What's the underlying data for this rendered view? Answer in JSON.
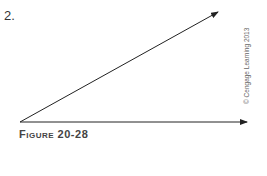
{
  "problem": {
    "number": "2."
  },
  "figure": {
    "caption": "Figure 20-28",
    "copyright": "© Cengage Learning 2013",
    "angle": {
      "vertex": [
        20,
        122
      ],
      "ray_horizontal_end": [
        248,
        122
      ],
      "ray_diagonal_end": [
        218,
        12
      ],
      "stroke": "#222222"
    }
  }
}
